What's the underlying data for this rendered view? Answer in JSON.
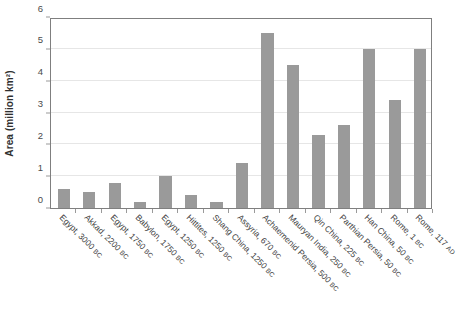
{
  "chart_data": {
    "type": "bar",
    "title": "",
    "xlabel": "",
    "ylabel": "Area (million km²)",
    "ylim": [
      0,
      6
    ],
    "ytick_labels": [
      "0",
      "1",
      "2",
      "3",
      "4",
      "5",
      "6"
    ],
    "yticks": [
      0,
      1,
      2,
      3,
      4,
      5,
      6
    ],
    "grid": true,
    "legend": false,
    "bar_color": "#9a9a9a",
    "axis_color": "#7f7f7f",
    "gridline_color": "#e6e6e6",
    "categories": [
      "Egypt, 3000 BC",
      "Akkad, 2200 BC",
      "Egypt, 1750 BC",
      "Babylon, 1750 BC",
      "Egypt, 1250 BC",
      "Hittites, 1250 BC",
      "Shang China, 1250 BC",
      "Assyria, 670 BC",
      "Achaemenid Persia, 500 BC",
      "Mauryan India, 250 BC",
      "Qin China, 225 BC",
      "Parthian Persia, 50 BC",
      "Han China, 50 BC",
      "Rome, 1 BC",
      "Rome, 117 AD"
    ],
    "category_names": [
      "Egypt,",
      "Akkad,",
      "Egypt,",
      "Babylon,",
      "Egypt,",
      "Hittites,",
      "Shang China,",
      "Assyria,",
      "Achaemenid Persia,",
      "Mauryan India,",
      "Qin China,",
      "Parthian Persia,",
      "Han China,",
      "Rome,",
      "Rome,"
    ],
    "category_years": [
      "3000",
      "2200",
      "1750",
      "1750",
      "1250",
      "1250",
      "1250",
      "670",
      "500",
      "250",
      "225",
      "50",
      "50",
      "1",
      "117"
    ],
    "category_eras": [
      "BC",
      "BC",
      "BC",
      "BC",
      "BC",
      "BC",
      "BC",
      "BC",
      "BC",
      "BC",
      "BC",
      "BC",
      "BC",
      "BC",
      "AD"
    ],
    "values": [
      0.6,
      0.5,
      0.8,
      0.2,
      1.0,
      0.4,
      0.2,
      1.4,
      5.5,
      4.5,
      2.3,
      2.6,
      5.0,
      3.4,
      5.0
    ]
  }
}
